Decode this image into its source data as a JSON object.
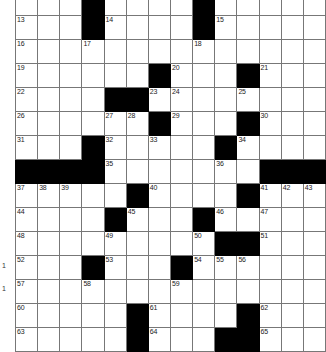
{
  "puzzle": {
    "title": "Crossword Grid",
    "columns": 13,
    "rows": 15,
    "colors": {
      "block": "#000000",
      "open": "#ffffff",
      "gridline": "#777777",
      "number": "#222222"
    },
    "edge_marks": [
      "1",
      "1"
    ],
    "rows_data": [
      {
        "index": 1,
        "cells": [
          {
            "block": false,
            "num": "1"
          },
          {
            "block": false,
            "num": "2"
          },
          {
            "block": false,
            "num": "3"
          },
          {
            "block": true,
            "num": ""
          },
          {
            "block": false,
            "num": "4"
          },
          {
            "block": false,
            "num": "5"
          },
          {
            "block": false,
            "num": "6"
          },
          {
            "block": false,
            "num": "7"
          },
          {
            "block": true,
            "num": ""
          },
          {
            "block": false,
            "num": "8"
          },
          {
            "block": false,
            "num": "9"
          },
          {
            "block": false,
            "num": "10"
          },
          {
            "block": false,
            "num": "11"
          },
          {
            "block": false,
            "num": "12"
          }
        ]
      },
      {
        "index": 2,
        "cells": [
          {
            "block": false,
            "num": "13"
          },
          {
            "block": false,
            "num": ""
          },
          {
            "block": false,
            "num": ""
          },
          {
            "block": true,
            "num": ""
          },
          {
            "block": false,
            "num": "14"
          },
          {
            "block": false,
            "num": ""
          },
          {
            "block": false,
            "num": ""
          },
          {
            "block": false,
            "num": ""
          },
          {
            "block": true,
            "num": ""
          },
          {
            "block": false,
            "num": "15"
          },
          {
            "block": false,
            "num": ""
          },
          {
            "block": false,
            "num": ""
          },
          {
            "block": false,
            "num": ""
          },
          {
            "block": false,
            "num": ""
          }
        ]
      },
      {
        "index": 3,
        "cells": [
          {
            "block": false,
            "num": "16"
          },
          {
            "block": false,
            "num": ""
          },
          {
            "block": false,
            "num": ""
          },
          {
            "block": false,
            "num": "17"
          },
          {
            "block": false,
            "num": ""
          },
          {
            "block": false,
            "num": ""
          },
          {
            "block": false,
            "num": ""
          },
          {
            "block": false,
            "num": ""
          },
          {
            "block": false,
            "num": "18"
          },
          {
            "block": false,
            "num": ""
          },
          {
            "block": false,
            "num": ""
          },
          {
            "block": false,
            "num": ""
          },
          {
            "block": false,
            "num": ""
          },
          {
            "block": false,
            "num": ""
          }
        ]
      },
      {
        "index": 4,
        "cells": [
          {
            "block": false,
            "num": "19"
          },
          {
            "block": false,
            "num": ""
          },
          {
            "block": false,
            "num": ""
          },
          {
            "block": false,
            "num": ""
          },
          {
            "block": false,
            "num": ""
          },
          {
            "block": false,
            "num": ""
          },
          {
            "block": true,
            "num": ""
          },
          {
            "block": false,
            "num": "20"
          },
          {
            "block": false,
            "num": ""
          },
          {
            "block": false,
            "num": ""
          },
          {
            "block": true,
            "num": ""
          },
          {
            "block": false,
            "num": "21"
          },
          {
            "block": false,
            "num": ""
          },
          {
            "block": false,
            "num": ""
          }
        ]
      },
      {
        "index": 5,
        "cells": [
          {
            "block": false,
            "num": "22"
          },
          {
            "block": false,
            "num": ""
          },
          {
            "block": false,
            "num": ""
          },
          {
            "block": false,
            "num": ""
          },
          {
            "block": true,
            "num": ""
          },
          {
            "block": true,
            "num": ""
          },
          {
            "block": false,
            "num": "23"
          },
          {
            "block": false,
            "num": "24"
          },
          {
            "block": false,
            "num": ""
          },
          {
            "block": false,
            "num": ""
          },
          {
            "block": false,
            "num": "25"
          },
          {
            "block": false,
            "num": ""
          },
          {
            "block": false,
            "num": ""
          },
          {
            "block": false,
            "num": ""
          }
        ]
      },
      {
        "index": 6,
        "cells": [
          {
            "block": false,
            "num": "26"
          },
          {
            "block": false,
            "num": ""
          },
          {
            "block": false,
            "num": ""
          },
          {
            "block": false,
            "num": ""
          },
          {
            "block": false,
            "num": "27"
          },
          {
            "block": false,
            "num": "28"
          },
          {
            "block": true,
            "num": ""
          },
          {
            "block": false,
            "num": "29"
          },
          {
            "block": false,
            "num": ""
          },
          {
            "block": false,
            "num": ""
          },
          {
            "block": true,
            "num": ""
          },
          {
            "block": false,
            "num": "30"
          },
          {
            "block": false,
            "num": ""
          },
          {
            "block": false,
            "num": ""
          }
        ]
      },
      {
        "index": 7,
        "cells": [
          {
            "block": false,
            "num": "31"
          },
          {
            "block": false,
            "num": ""
          },
          {
            "block": false,
            "num": ""
          },
          {
            "block": true,
            "num": ""
          },
          {
            "block": false,
            "num": "32"
          },
          {
            "block": false,
            "num": ""
          },
          {
            "block": false,
            "num": "33"
          },
          {
            "block": false,
            "num": ""
          },
          {
            "block": false,
            "num": ""
          },
          {
            "block": true,
            "num": ""
          },
          {
            "block": false,
            "num": "34"
          },
          {
            "block": false,
            "num": ""
          },
          {
            "block": false,
            "num": ""
          },
          {
            "block": false,
            "num": ""
          }
        ]
      },
      {
        "index": 8,
        "cells": [
          {
            "block": true,
            "num": ""
          },
          {
            "block": true,
            "num": ""
          },
          {
            "block": true,
            "num": ""
          },
          {
            "block": true,
            "num": ""
          },
          {
            "block": false,
            "num": "35"
          },
          {
            "block": false,
            "num": ""
          },
          {
            "block": false,
            "num": ""
          },
          {
            "block": false,
            "num": ""
          },
          {
            "block": false,
            "num": ""
          },
          {
            "block": false,
            "num": "36"
          },
          {
            "block": false,
            "num": ""
          },
          {
            "block": true,
            "num": ""
          },
          {
            "block": true,
            "num": ""
          },
          {
            "block": true,
            "num": ""
          }
        ]
      },
      {
        "index": 9,
        "cells": [
          {
            "block": false,
            "num": "37"
          },
          {
            "block": false,
            "num": "38"
          },
          {
            "block": false,
            "num": "39"
          },
          {
            "block": false,
            "num": ""
          },
          {
            "block": false,
            "num": ""
          },
          {
            "block": true,
            "num": ""
          },
          {
            "block": false,
            "num": "40"
          },
          {
            "block": false,
            "num": ""
          },
          {
            "block": false,
            "num": ""
          },
          {
            "block": false,
            "num": ""
          },
          {
            "block": true,
            "num": ""
          },
          {
            "block": false,
            "num": "41"
          },
          {
            "block": false,
            "num": "42"
          },
          {
            "block": false,
            "num": "43"
          }
        ]
      },
      {
        "index": 10,
        "cells": [
          {
            "block": false,
            "num": "44"
          },
          {
            "block": false,
            "num": ""
          },
          {
            "block": false,
            "num": ""
          },
          {
            "block": false,
            "num": ""
          },
          {
            "block": true,
            "num": ""
          },
          {
            "block": false,
            "num": "45"
          },
          {
            "block": false,
            "num": ""
          },
          {
            "block": false,
            "num": ""
          },
          {
            "block": true,
            "num": ""
          },
          {
            "block": false,
            "num": "46"
          },
          {
            "block": false,
            "num": ""
          },
          {
            "block": false,
            "num": "47"
          },
          {
            "block": false,
            "num": ""
          },
          {
            "block": false,
            "num": ""
          }
        ]
      },
      {
        "index": 11,
        "cells": [
          {
            "block": false,
            "num": "48"
          },
          {
            "block": false,
            "num": ""
          },
          {
            "block": false,
            "num": ""
          },
          {
            "block": false,
            "num": ""
          },
          {
            "block": false,
            "num": "49"
          },
          {
            "block": false,
            "num": ""
          },
          {
            "block": false,
            "num": ""
          },
          {
            "block": false,
            "num": ""
          },
          {
            "block": false,
            "num": "50"
          },
          {
            "block": true,
            "num": ""
          },
          {
            "block": true,
            "num": ""
          },
          {
            "block": false,
            "num": "51"
          },
          {
            "block": false,
            "num": ""
          },
          {
            "block": false,
            "num": ""
          }
        ]
      },
      {
        "index": 12,
        "cells": [
          {
            "block": false,
            "num": "52"
          },
          {
            "block": false,
            "num": ""
          },
          {
            "block": false,
            "num": ""
          },
          {
            "block": true,
            "num": ""
          },
          {
            "block": false,
            "num": "53"
          },
          {
            "block": false,
            "num": ""
          },
          {
            "block": false,
            "num": ""
          },
          {
            "block": true,
            "num": ""
          },
          {
            "block": false,
            "num": "54"
          },
          {
            "block": false,
            "num": "55"
          },
          {
            "block": false,
            "num": "56"
          },
          {
            "block": false,
            "num": ""
          },
          {
            "block": false,
            "num": ""
          },
          {
            "block": false,
            "num": ""
          }
        ]
      },
      {
        "index": 13,
        "cells": [
          {
            "block": false,
            "num": "57"
          },
          {
            "block": false,
            "num": ""
          },
          {
            "block": false,
            "num": ""
          },
          {
            "block": false,
            "num": "58"
          },
          {
            "block": false,
            "num": ""
          },
          {
            "block": false,
            "num": ""
          },
          {
            "block": false,
            "num": ""
          },
          {
            "block": false,
            "num": "59"
          },
          {
            "block": false,
            "num": ""
          },
          {
            "block": false,
            "num": ""
          },
          {
            "block": false,
            "num": ""
          },
          {
            "block": false,
            "num": ""
          },
          {
            "block": false,
            "num": ""
          },
          {
            "block": false,
            "num": ""
          }
        ]
      },
      {
        "index": 14,
        "cells": [
          {
            "block": false,
            "num": "60"
          },
          {
            "block": false,
            "num": ""
          },
          {
            "block": false,
            "num": ""
          },
          {
            "block": false,
            "num": ""
          },
          {
            "block": false,
            "num": ""
          },
          {
            "block": true,
            "num": ""
          },
          {
            "block": false,
            "num": "61"
          },
          {
            "block": false,
            "num": ""
          },
          {
            "block": false,
            "num": ""
          },
          {
            "block": false,
            "num": ""
          },
          {
            "block": true,
            "num": ""
          },
          {
            "block": false,
            "num": "62"
          },
          {
            "block": false,
            "num": ""
          },
          {
            "block": false,
            "num": ""
          }
        ]
      },
      {
        "index": 15,
        "cells": [
          {
            "block": false,
            "num": "63"
          },
          {
            "block": false,
            "num": ""
          },
          {
            "block": false,
            "num": ""
          },
          {
            "block": false,
            "num": ""
          },
          {
            "block": false,
            "num": ""
          },
          {
            "block": true,
            "num": ""
          },
          {
            "block": false,
            "num": "64"
          },
          {
            "block": false,
            "num": ""
          },
          {
            "block": false,
            "num": ""
          },
          {
            "block": true,
            "num": ""
          },
          {
            "block": true,
            "num": ""
          },
          {
            "block": false,
            "num": "65"
          },
          {
            "block": false,
            "num": ""
          },
          {
            "block": false,
            "num": ""
          }
        ]
      }
    ]
  }
}
